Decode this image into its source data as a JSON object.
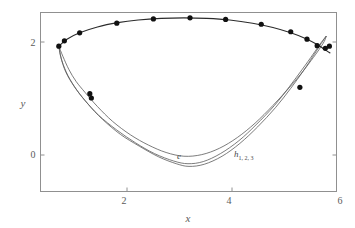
{
  "figure": {
    "title": "",
    "background_color": "#ffffff",
    "frame_color": "#909090",
    "curve_color": "#5a5a5a",
    "marker_color": "#111111"
  },
  "chart_data": {
    "type": "line",
    "title": "",
    "xlabel": "x",
    "ylabel": "y",
    "xlim": [
      0.18,
      6.0
    ],
    "ylim": [
      -0.73,
      2.62
    ],
    "xticks": [
      2,
      4,
      6
    ],
    "xtick_labels": [
      "2",
      "4",
      "6"
    ],
    "yticks": [
      0,
      2
    ],
    "ytick_labels": [
      "0",
      "2"
    ],
    "grid": false,
    "legend": "inline-annotations",
    "annotations": [
      {
        "text": "e",
        "sub": "",
        "x": 3.07,
        "y": 0.06
      },
      {
        "text": "h",
        "sub": "1, 2, 3",
        "x": 4.48,
        "y": 0.02
      }
    ],
    "series": [
      {
        "name": "e",
        "style": "thin-line",
        "points": [
          [
            0.54,
            1.99
          ],
          [
            0.62,
            1.8
          ],
          [
            0.74,
            1.55
          ],
          [
            0.88,
            1.33
          ],
          [
            1.06,
            1.12
          ],
          [
            1.3,
            0.86
          ],
          [
            1.6,
            0.58
          ],
          [
            1.95,
            0.33
          ],
          [
            2.3,
            0.14
          ],
          [
            2.65,
            0.0
          ],
          [
            3.0,
            -0.07
          ],
          [
            3.35,
            -0.04
          ],
          [
            3.7,
            0.08
          ],
          [
            4.05,
            0.28
          ],
          [
            4.4,
            0.55
          ],
          [
            4.75,
            0.88
          ],
          [
            5.05,
            1.19
          ],
          [
            5.3,
            1.47
          ],
          [
            5.5,
            1.72
          ],
          [
            5.66,
            1.93
          ],
          [
            5.76,
            2.08
          ],
          [
            5.8,
            2.18
          ]
        ]
      },
      {
        "name": "h1",
        "style": "thin-line",
        "points": [
          [
            0.54,
            1.99
          ],
          [
            0.6,
            1.72
          ],
          [
            0.72,
            1.44
          ],
          [
            0.9,
            1.16
          ],
          [
            1.12,
            0.9
          ],
          [
            1.4,
            0.62
          ],
          [
            1.75,
            0.34
          ],
          [
            2.12,
            0.12
          ],
          [
            2.5,
            -0.08
          ],
          [
            2.85,
            -0.21
          ],
          [
            3.1,
            -0.26
          ],
          [
            3.4,
            -0.22
          ],
          [
            3.75,
            -0.07
          ],
          [
            4.1,
            0.17
          ],
          [
            4.45,
            0.48
          ],
          [
            4.8,
            0.84
          ],
          [
            5.1,
            1.2
          ],
          [
            5.35,
            1.53
          ],
          [
            5.55,
            1.82
          ],
          [
            5.7,
            2.04
          ],
          [
            5.8,
            2.18
          ]
        ]
      },
      {
        "name": "h2",
        "style": "thin-line",
        "points": [
          [
            0.54,
            1.99
          ],
          [
            0.58,
            1.78
          ],
          [
            0.68,
            1.5
          ],
          [
            0.84,
            1.24
          ],
          [
            1.05,
            0.98
          ],
          [
            1.32,
            0.7
          ],
          [
            1.68,
            0.42
          ],
          [
            2.05,
            0.18
          ],
          [
            2.42,
            -0.02
          ],
          [
            2.8,
            -0.16
          ],
          [
            3.08,
            -0.21
          ],
          [
            3.38,
            -0.17
          ],
          [
            3.72,
            -0.02
          ],
          [
            4.08,
            0.22
          ],
          [
            4.42,
            0.52
          ],
          [
            4.78,
            0.88
          ],
          [
            5.08,
            1.24
          ],
          [
            5.33,
            1.56
          ],
          [
            5.54,
            1.84
          ],
          [
            5.7,
            2.06
          ],
          [
            5.8,
            2.18
          ]
        ]
      },
      {
        "name": "outer-upper",
        "style": "main-line",
        "points": [
          [
            0.54,
            1.99
          ],
          [
            0.7,
            2.12
          ],
          [
            0.95,
            2.24
          ],
          [
            1.3,
            2.35
          ],
          [
            1.7,
            2.43
          ],
          [
            2.1,
            2.48
          ],
          [
            2.55,
            2.51
          ],
          [
            3.0,
            2.52
          ],
          [
            3.45,
            2.51
          ],
          [
            3.9,
            2.48
          ],
          [
            4.35,
            2.42
          ],
          [
            4.75,
            2.34
          ],
          [
            5.1,
            2.24
          ],
          [
            5.4,
            2.13
          ],
          [
            5.62,
            2.02
          ],
          [
            5.78,
            1.92
          ],
          [
            5.88,
            1.86
          ]
        ]
      }
    ],
    "marker_points": [
      [
        0.54,
        1.99
      ],
      [
        0.65,
        2.09
      ],
      [
        0.95,
        2.24
      ],
      [
        1.68,
        2.42
      ],
      [
        2.4,
        2.5
      ],
      [
        3.12,
        2.52
      ],
      [
        3.82,
        2.49
      ],
      [
        4.52,
        2.4
      ],
      [
        5.1,
        2.26
      ],
      [
        5.42,
        2.12
      ],
      [
        5.62,
        2.0
      ],
      [
        5.78,
        1.95
      ],
      [
        5.86,
        1.99
      ],
      [
        1.15,
        1.1
      ],
      [
        1.18,
        1.02
      ],
      [
        5.28,
        1.22
      ]
    ]
  }
}
